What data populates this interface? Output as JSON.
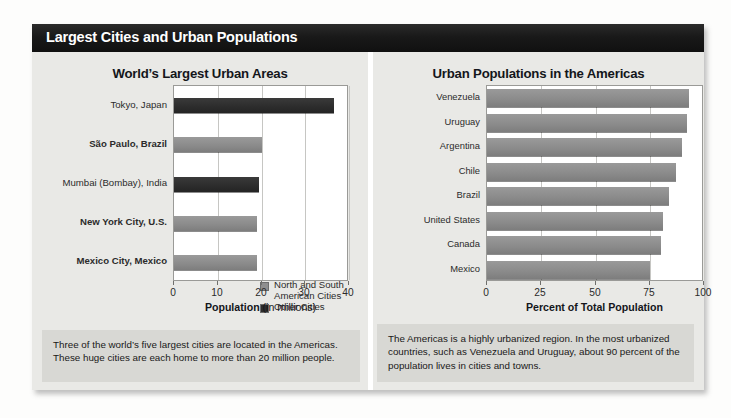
{
  "panel": {
    "title": "Largest Cities and Urban Populations"
  },
  "left_panel": {
    "caption": "Three of the world’s five largest cities are located in the Americas. These huge cities are each home to more than 20 million people.",
    "legend": [
      {
        "label": "North and South American Cities",
        "color": "#8f8f8f",
        "key": "americas"
      },
      {
        "label": "Other Cities",
        "color": "#2d2d2d",
        "key": "other"
      }
    ]
  },
  "right_panel": {
    "caption": "The Americas is a highly urbanized region. In the most urbanized countries, such as Venezuela and Uruguay, about 90 percent of the population lives in cities and towns."
  },
  "chart_data": [
    {
      "id": "worlds-largest-urban-areas",
      "type": "bar",
      "orientation": "horizontal",
      "title": "World’s Largest Urban Areas",
      "xlabel": "Population",
      "xlabel_suffix": " (in millions)",
      "ylabel": "",
      "xlim": [
        0,
        40
      ],
      "xticks": [
        0,
        10,
        20,
        30,
        40
      ],
      "xtick_labels": [
        "0",
        "10",
        "20",
        "30",
        "40"
      ],
      "grid": true,
      "legend_position": "inside-bottom-right",
      "categories": [
        "Tokyo, Japan",
        "São Paulo, Brazil",
        "Mumbai (Bombay), India",
        "New York City, U.S.",
        "Mexico City, Mexico"
      ],
      "values": [
        36.5,
        20.0,
        19.5,
        19.0,
        19.0
      ],
      "groups": [
        "other",
        "americas",
        "other",
        "americas",
        "americas"
      ],
      "bold_labels": [
        false,
        true,
        false,
        true,
        true
      ],
      "colors": {
        "americas": "#8a8a8a",
        "other": "#2c2c2c"
      }
    },
    {
      "id": "urban-populations-in-the-americas",
      "type": "bar",
      "orientation": "horizontal",
      "title": "Urban Populations in the Americas",
      "xlabel": "Percent of Total Population",
      "xlabel_suffix": "",
      "ylabel": "",
      "xlim": [
        0,
        100
      ],
      "xticks": [
        0,
        25,
        50,
        75,
        100
      ],
      "xtick_labels": [
        "0",
        "25",
        "50",
        "75",
        "100"
      ],
      "grid": true,
      "legend_position": "none",
      "categories": [
        "Venezuela",
        "Uruguay",
        "Argentina",
        "Chile",
        "Brazil",
        "United States",
        "Canada",
        "Mexico"
      ],
      "values": [
        93,
        92,
        90,
        87,
        84,
        81,
        80,
        75
      ],
      "groups": [
        "americas",
        "americas",
        "americas",
        "americas",
        "americas",
        "americas",
        "americas",
        "americas"
      ],
      "bold_labels": [
        false,
        false,
        false,
        false,
        false,
        false,
        false,
        false
      ],
      "colors": {
        "americas": "#8a8a8a",
        "other": "#2c2c2c"
      }
    }
  ]
}
